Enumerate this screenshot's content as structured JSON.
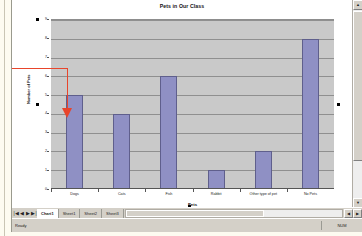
{
  "window": {
    "app": "spreadsheet-chart-sheet"
  },
  "chart_data": {
    "type": "bar",
    "title": "Pets in Our Class",
    "xlabel": "Pets",
    "ylabel": "Number of Pets",
    "categories": [
      "Dogs",
      "Cats",
      "Fish",
      "Rabbit",
      "Other type of pet",
      "No Pets"
    ],
    "values": [
      5,
      4,
      6,
      1,
      2,
      8
    ],
    "ylim": [
      0,
      9
    ],
    "yticks": [
      0,
      1,
      2,
      3,
      4,
      5,
      6,
      7,
      8,
      9
    ],
    "grid": true,
    "legend": false,
    "bar_color": "#8f90c4",
    "plot_background": "#c9c9c9",
    "gridline_color": "#8f8f8f"
  },
  "annotation": {
    "color": "#e8452b",
    "shape": "elbow-arrow-pointing-down-into-dogs-bar"
  },
  "tabbar": {
    "nav": {
      "first": "|◀",
      "prev": "◀",
      "next": "▶",
      "last": "▶|"
    },
    "tabs": [
      {
        "label": "Chart1",
        "active": true
      },
      {
        "label": "Sheet1",
        "active": false
      },
      {
        "label": "Sheet2",
        "active": false
      },
      {
        "label": "Sheet3",
        "active": false
      }
    ],
    "hscroll_left": "◀",
    "hscroll_right": "▶"
  },
  "statusbar": {
    "message": "Ready",
    "indicator": "NUM"
  },
  "vscroll": {
    "up": "▲",
    "down": "▼"
  }
}
